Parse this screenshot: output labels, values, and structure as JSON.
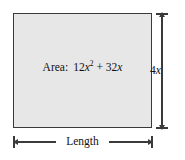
{
  "figure": {
    "type": "geometry-diagram",
    "shape": "rectangle",
    "fill_color": "#e7e7e7",
    "stroke_color": "#3a3a3a",
    "background_color": "#ffffff",
    "area_label": {
      "prefix": "Area:",
      "expression_plain": "12x^2 + 32x",
      "term1_coefficient": "12",
      "term1_variable": "x",
      "term1_exponent": "2",
      "operator": "+",
      "term2": "32",
      "term2_variable": "x"
    },
    "height_dimension": {
      "value": "4",
      "variable": "x",
      "label_plain": "4x"
    },
    "width_dimension": {
      "label": "Length"
    }
  }
}
